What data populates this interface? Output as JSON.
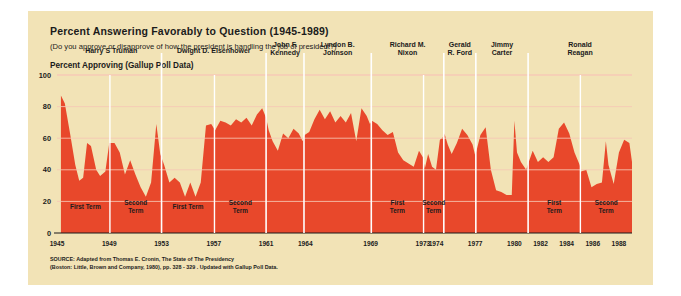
{
  "header": {
    "title": "Percent Answering Favorably to Question (1945-1989)",
    "subtitle": "(Do you approve or disapprove of how the president is handling the job of president?)",
    "axis_caption": "Percent Approving (Gallup Poll Data)"
  },
  "source": {
    "line1": "SOURCE: Adapted from Thomas E. Cronin, The State of The Presidency",
    "line2": "(Boston: Little, Brown and Company, 1980), pp. 328 - 329 . Updated with Gallup Poll Data."
  },
  "colors": {
    "panel": "#f2e3b6",
    "area": "#e8482b",
    "gridline": "#f7c9b6",
    "axis": "#1b1b1b",
    "page": "#ffffff"
  },
  "chart_data": {
    "type": "area",
    "title": "Percent Answering Favorably to Question (1945-1989)",
    "xlabel": "",
    "ylabel": "Percent Approving (Gallup Poll Data)",
    "ylim": [
      0,
      100
    ],
    "xlim": [
      1945,
      1989
    ],
    "yticks": [
      0,
      20,
      40,
      60,
      80,
      100
    ],
    "xticks": [
      1945,
      1949,
      1953,
      1957,
      1961,
      1964,
      1969,
      1973,
      1974,
      1977,
      1980,
      1982,
      1984,
      1986,
      1988
    ],
    "grid": true,
    "legend": "none",
    "series_name": "Presidential Approval",
    "x": [
      1945.3,
      1945.6,
      1946.0,
      1946.4,
      1946.7,
      1947.0,
      1947.3,
      1947.6,
      1948.0,
      1948.3,
      1948.7,
      1949.0,
      1949.4,
      1949.8,
      1950.2,
      1950.6,
      1951.0,
      1951.4,
      1951.8,
      1952.2,
      1952.6,
      1952.9,
      1953.2,
      1953.6,
      1954.0,
      1954.4,
      1954.8,
      1955.2,
      1955.6,
      1956.0,
      1956.4,
      1956.8,
      1957.1,
      1957.5,
      1957.9,
      1958.3,
      1958.7,
      1959.1,
      1959.5,
      1959.9,
      1960.3,
      1960.7,
      1961.0,
      1961.2,
      1961.5,
      1961.9,
      1962.3,
      1962.7,
      1963.1,
      1963.5,
      1963.8,
      1963.95,
      1964.3,
      1964.7,
      1965.1,
      1965.5,
      1965.9,
      1966.3,
      1966.7,
      1967.1,
      1967.5,
      1967.9,
      1968.3,
      1968.7,
      1968.95,
      1969.1,
      1969.5,
      1969.9,
      1970.3,
      1970.7,
      1971.1,
      1971.5,
      1971.9,
      1972.3,
      1972.7,
      1973.0,
      1973.15,
      1973.4,
      1973.7,
      1974.0,
      1974.3,
      1974.6,
      1974.65,
      1974.9,
      1975.2,
      1975.6,
      1976.0,
      1976.4,
      1976.8,
      1977.0,
      1977.1,
      1977.4,
      1977.8,
      1978.2,
      1978.6,
      1979.0,
      1979.4,
      1979.8,
      1980.0,
      1980.2,
      1980.5,
      1980.9,
      1981.1,
      1981.4,
      1981.8,
      1982.2,
      1982.6,
      1983.0,
      1983.4,
      1983.8,
      1984.2,
      1984.6,
      1985.0,
      1985.1,
      1985.5,
      1985.9,
      1986.3,
      1986.7,
      1987.0,
      1987.2,
      1987.6,
      1988.0,
      1988.4,
      1988.8,
      1989.0
    ],
    "y": [
      87,
      82,
      63,
      43,
      33,
      35,
      57,
      55,
      40,
      36,
      39,
      57,
      57,
      51,
      37,
      46,
      37,
      29,
      23,
      32,
      69,
      50,
      43,
      32,
      35,
      32,
      23,
      32,
      23,
      32,
      68,
      69,
      65,
      71,
      70,
      68,
      72,
      70,
      73,
      68,
      75,
      79,
      73,
      65,
      58,
      52,
      63,
      60,
      66,
      63,
      58,
      62,
      64,
      72,
      78,
      72,
      77,
      70,
      74,
      70,
      76,
      58,
      79,
      74,
      69,
      71,
      69,
      65,
      62,
      64,
      51,
      46,
      44,
      42,
      52,
      48,
      41,
      50,
      42,
      40,
      59,
      61,
      63,
      56,
      50,
      57,
      66,
      62,
      56,
      49,
      52,
      62,
      67,
      40,
      27,
      26,
      24,
      24,
      71,
      51,
      45,
      40,
      45,
      52,
      45,
      48,
      45,
      48,
      66,
      70,
      63,
      51,
      43,
      39,
      40,
      29,
      31,
      32,
      58,
      43,
      31,
      51,
      59,
      57,
      45,
      43,
      35,
      41,
      45,
      51,
      54,
      58,
      60,
      62,
      58,
      56,
      61,
      64,
      68,
      63,
      47,
      43,
      49,
      53,
      57,
      60,
      49,
      63
    ],
    "annotations": [
      {
        "label": "Harry S Truman",
        "start": 1945.3,
        "end": 1953.0
      },
      {
        "label": "Dwight D. Eisenhower",
        "start": 1953.0,
        "end": 1961.0
      },
      {
        "label": "John F.\nKennedy",
        "start": 1961.0,
        "end": 1963.9
      },
      {
        "label": "Lyndon B.\nJohnson",
        "start": 1963.9,
        "end": 1969.05
      },
      {
        "label": "Richard M.\nNixon",
        "start": 1969.05,
        "end": 1974.6
      },
      {
        "label": "Gerald\nR. Ford",
        "start": 1974.6,
        "end": 1977.05
      },
      {
        "label": "Jimmy\nCarter",
        "start": 1977.05,
        "end": 1981.05
      },
      {
        "label": "Ronald\nReagan",
        "start": 1981.05,
        "end": 1989.0
      }
    ]
  },
  "presidents": [
    {
      "name_line1": "Harry S Truman",
      "name_line2": "",
      "start": 1945.3,
      "end": 1953.0,
      "divider": 1949.05,
      "terms": [
        {
          "l1": "First Term",
          "l2": "",
          "start": 1945.3,
          "end": 1949.05
        },
        {
          "l1": "Second",
          "l2": "Term",
          "start": 1949.05,
          "end": 1953.0
        }
      ]
    },
    {
      "name_line1": "Dwight D. Eisenhower",
      "name_line2": "",
      "start": 1953.0,
      "end": 1961.0,
      "divider": 1957.05,
      "terms": [
        {
          "l1": "First Term",
          "l2": "",
          "start": 1953.0,
          "end": 1957.05
        },
        {
          "l1": "Second",
          "l2": "Term",
          "start": 1957.05,
          "end": 1961.0
        }
      ]
    },
    {
      "name_line1": "John F.",
      "name_line2": "Kennedy",
      "start": 1961.0,
      "end": 1963.9,
      "divider": null,
      "terms": []
    },
    {
      "name_line1": "Lyndon B.",
      "name_line2": "Johnson",
      "start": 1963.9,
      "end": 1969.05,
      "divider": null,
      "terms": []
    },
    {
      "name_line1": "Richard M.",
      "name_line2": "Nixon",
      "start": 1969.05,
      "end": 1974.6,
      "divider": 1973.05,
      "terms": [
        {
          "l1": "First",
          "l2": "Term",
          "start": 1969.05,
          "end": 1973.05
        },
        {
          "l1": "Second",
          "l2": "Term",
          "start": 1973.05,
          "end": 1974.6
        }
      ]
    },
    {
      "name_line1": "Gerald",
      "name_line2": "R. Ford",
      "start": 1974.6,
      "end": 1977.05,
      "divider": null,
      "terms": []
    },
    {
      "name_line1": "Jimmy",
      "name_line2": "Carter",
      "start": 1977.05,
      "end": 1981.05,
      "divider": null,
      "terms": []
    },
    {
      "name_line1": "Ronald",
      "name_line2": "Reagan",
      "start": 1981.05,
      "end": 1989.0,
      "divider": 1985.05,
      "terms": [
        {
          "l1": "First",
          "l2": "Term",
          "start": 1981.05,
          "end": 1985.05
        },
        {
          "l1": "Second",
          "l2": "Term",
          "start": 1985.05,
          "end": 1989.0
        }
      ]
    }
  ]
}
